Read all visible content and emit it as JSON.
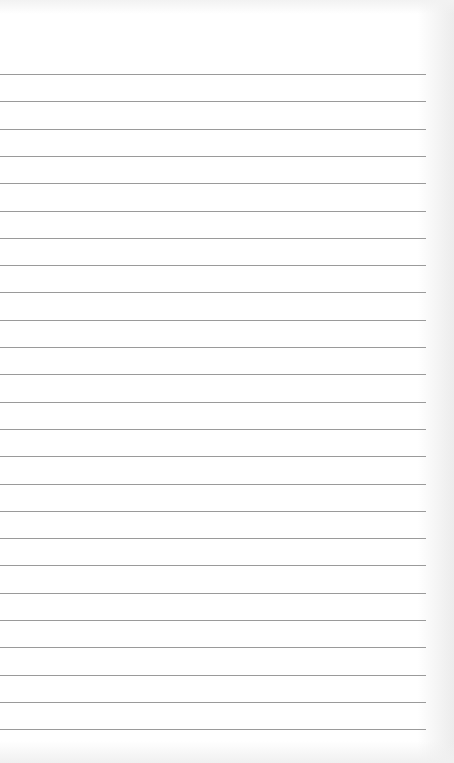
{
  "paper": {
    "type": "lined-paper",
    "line_count": 25,
    "first_line_y": 74,
    "line_spacing": 27.3,
    "line_length": 426,
    "line_color": "#9a9a9a",
    "background_color": "#ffffff"
  }
}
